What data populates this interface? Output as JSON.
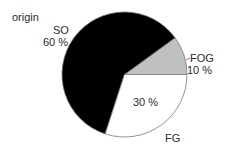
{
  "chart_data": {
    "type": "pie",
    "title": "origin",
    "slices": [
      {
        "label": "FOG",
        "value": 10,
        "value_label": "10 %",
        "color": "#c0c0c0"
      },
      {
        "label": "SO",
        "value": 60,
        "value_label": "60 %",
        "color": "#000000"
      },
      {
        "label": "FG",
        "value": 30,
        "value_label": "30 %",
        "color": "#ffffff"
      }
    ],
    "start_angle_deg": 0,
    "direction": "counterclockwise",
    "legend": "none"
  },
  "labels": {
    "title": "origin",
    "so_name": "SO",
    "so_pct": "60 %",
    "fog_name": "FOG",
    "fog_pct": "10 %",
    "fg_name": "FG",
    "fg_pct": "30 %"
  }
}
